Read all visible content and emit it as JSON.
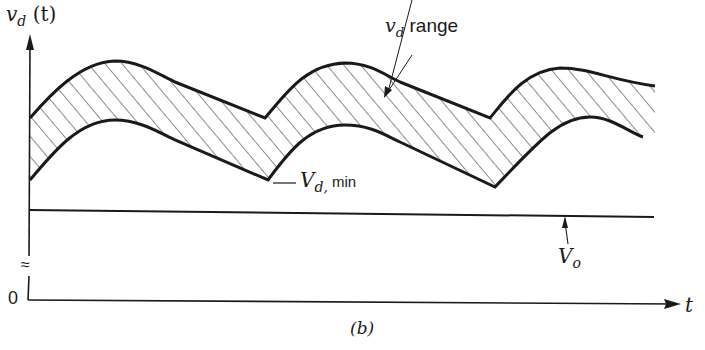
{
  "figure": {
    "caption": "(b)",
    "y_axis_label": {
      "var": "v",
      "sub": "d",
      "arg": "(t)"
    },
    "x_axis_label": "t",
    "origin_label": "0",
    "axis_break_symbol": "≈",
    "annotations": {
      "vd_range": {
        "var": "v",
        "sub": "d",
        "text": " range"
      },
      "vd_min": {
        "var": "V",
        "sub": "d,",
        "text": " min"
      },
      "vo": {
        "var": "V",
        "sub": "o"
      }
    }
  },
  "colors": {
    "ink": "#1a1a1a",
    "background": "#ffffff"
  }
}
